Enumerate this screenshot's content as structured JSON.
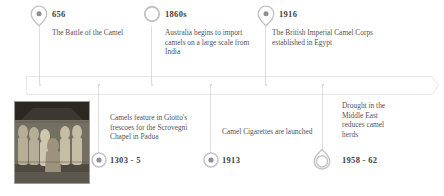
{
  "figure": {
    "axis_color": "#e6e6e8",
    "text_color": "#53535a",
    "year_color": "#3f3f41",
    "marker_color": "#b9b9bd"
  },
  "events": [
    {
      "id": "battle-of-the-camel",
      "year": "656",
      "description": "The Battle of the Camel",
      "marker": "pin-dot-marker",
      "side": "above"
    },
    {
      "id": "australia-imports-camels",
      "year": "1860s",
      "description": "Australia begins to import camels on a large scale from India",
      "marker": "ring-marker",
      "side": "above"
    },
    {
      "id": "british-imperial-camel-corps",
      "year": "1916",
      "description": "The British Imperial Camel Corps established in Egypt",
      "marker": "pin-dot-marker",
      "side": "above"
    },
    {
      "id": "giotto-frescoes",
      "year": "1303 - 5",
      "description": "Camels feature in Giotto's frescoes for the Scrovegni Chapel in Padua",
      "marker": "ring-dot-marker",
      "side": "below"
    },
    {
      "id": "camel-cigarettes-launched",
      "year": "1913",
      "description": "Camel Cigarettes are launched",
      "marker": "ring-dot-marker",
      "side": "below"
    },
    {
      "id": "middle-east-drought",
      "year": "1958 - 62",
      "description": "Drought in the Middle East reduces camel herds",
      "marker": "inverted-pin-marker",
      "side": "below"
    }
  ],
  "thumbnail": {
    "name": "giotto-fresco-thumbnail",
    "alt": "Giotto fresco detail with figures and camel"
  }
}
